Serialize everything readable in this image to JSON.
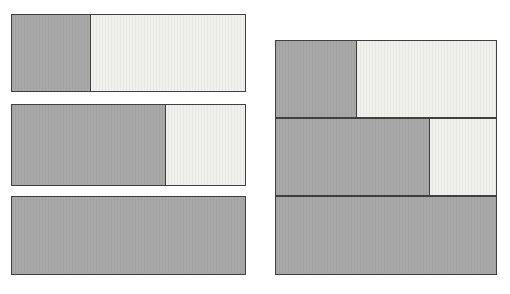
{
  "figure": {
    "title": "",
    "background_color": "#ffffff",
    "dark_color": "#a8a8a8",
    "light_color": "#f0f0ec",
    "outline_color": "#3f3f3f"
  },
  "chart_data": {
    "type": "bar",
    "title": "",
    "subtitle": "",
    "xlabel": "",
    "ylabel": "",
    "orientation": "horizontal",
    "stacked": true,
    "normalized": true,
    "grid": false,
    "legend": "none",
    "xlim": [
      0,
      100
    ],
    "tick_labels": [],
    "annotations": [],
    "legend_entries": [
      {
        "name": "Filled",
        "color": "#a8a8a8"
      },
      {
        "name": "Remainder",
        "color": "#f0f0ec"
      }
    ],
    "panels": [
      {
        "name": "left-panel",
        "layout": "separated",
        "categories": [
          "Bar 1",
          "Bar 2",
          "Bar 3"
        ],
        "series": [
          {
            "name": "Filled",
            "values": [
              34,
              66,
              100
            ]
          },
          {
            "name": "Remainder",
            "values": [
              66,
              34,
              0
            ]
          }
        ]
      },
      {
        "name": "right-panel",
        "layout": "contiguous",
        "categories": [
          "Bar 1",
          "Bar 2",
          "Bar 3"
        ],
        "series": [
          {
            "name": "Filled",
            "values": [
              37,
              70,
              100
            ]
          },
          {
            "name": "Remainder",
            "values": [
              63,
              30,
              0
            ]
          }
        ]
      }
    ]
  },
  "panels": {
    "left": {
      "label": "left-bar-group",
      "bars": [
        {
          "label": "left-bar-1",
          "fill_percent": 34,
          "fill_css": "34%",
          "full": false
        },
        {
          "label": "left-bar-2",
          "fill_percent": 66,
          "fill_css": "66%",
          "full": false
        },
        {
          "label": "left-bar-3",
          "fill_percent": 100,
          "fill_css": "100%",
          "full": true
        }
      ]
    },
    "right": {
      "label": "right-bar-group",
      "bars": [
        {
          "label": "right-bar-1",
          "fill_percent": 37,
          "fill_css": "37%",
          "full": false
        },
        {
          "label": "right-bar-2",
          "fill_percent": 70,
          "fill_css": "70%",
          "full": false
        },
        {
          "label": "right-bar-3",
          "fill_percent": 100,
          "fill_css": "100%",
          "full": true
        }
      ]
    }
  }
}
